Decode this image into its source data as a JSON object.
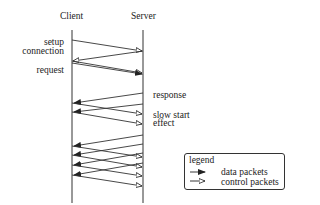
{
  "diagram": {
    "columns": {
      "client": "Client",
      "server": "Server"
    },
    "annotations": {
      "setup_line1": "setup",
      "setup_line2": "connection",
      "request": "request",
      "response": "response",
      "slow_start_line1": "slow start",
      "slow_start_line2": "effect"
    },
    "legend": {
      "title": "legend",
      "items": [
        {
          "label": "data packets",
          "arrow": "filled-arrow"
        },
        {
          "label": "control packets",
          "arrow": "open-arrow"
        }
      ]
    },
    "colors": {
      "line": "#333333",
      "background": "#ffffff"
    }
  }
}
